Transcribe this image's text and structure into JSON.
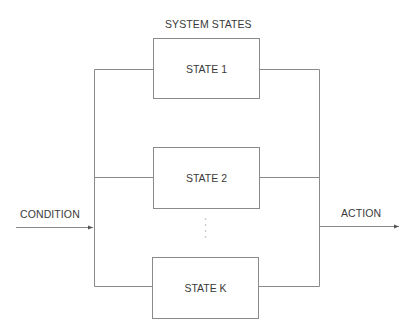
{
  "diagram": {
    "title": "SYSTEM STATES",
    "input_label": "CONDITION",
    "output_label": "ACTION",
    "states": [
      {
        "label": "STATE 1"
      },
      {
        "label": "STATE 2"
      },
      {
        "label": "STATE K"
      }
    ],
    "ellipsis": "⋮",
    "colors": {
      "line": "#8a8a8a",
      "text": "#3a3a3a",
      "background": "#ffffff"
    }
  }
}
